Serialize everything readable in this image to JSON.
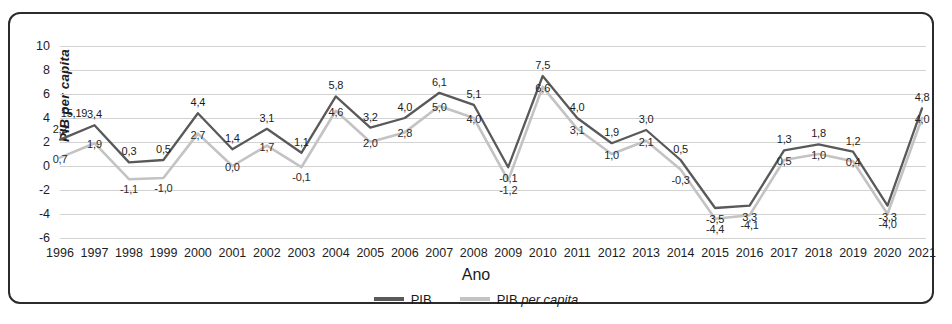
{
  "chart_data": {
    "type": "line",
    "title": "",
    "xlabel": "Ano",
    "ylabel": "PIB per capita",
    "ylim": [
      -6,
      10
    ],
    "yticks": [
      10,
      8,
      6,
      4,
      2,
      0,
      -2,
      -4,
      -6
    ],
    "grid": true,
    "legend_position": "bottom",
    "categories": [
      "1996",
      "1997",
      "1998",
      "1999",
      "2000",
      "2001",
      "2002",
      "2003",
      "2004",
      "2005",
      "2006",
      "2007",
      "2008",
      "2009",
      "2010",
      "2011",
      "2012",
      "2013",
      "2014",
      "2015",
      "2016",
      "2017",
      "2018",
      "2019",
      "2020",
      "2021"
    ],
    "series": [
      {
        "name": "PIB",
        "color": "#595959",
        "values": [
          2.2,
          3.4,
          0.3,
          0.5,
          4.4,
          1.4,
          3.1,
          1.1,
          5.8,
          3.2,
          4.0,
          6.1,
          5.1,
          -0.1,
          7.5,
          4.0,
          1.9,
          3.0,
          0.5,
          -3.5,
          -3.3,
          1.3,
          1.8,
          1.2,
          -3.3,
          4.8
        ],
        "labels": [
          "2,2",
          "3,4",
          "0,3",
          "0,5",
          "4,4",
          "1,4",
          "3,1",
          "1,1",
          "5,8",
          "3,2",
          "4,0",
          "6,1",
          "5,1",
          "-0,1",
          "7,5",
          "4,0",
          "1,9",
          "3,0",
          "0,5",
          "-3,5",
          "3,3",
          "1,3",
          "1,8",
          "1,2",
          "-3,3",
          "4,8"
        ]
      },
      {
        "name": "PIB per capita",
        "color": "#c3c3c3",
        "values": [
          0.7,
          1.9,
          -1.1,
          -1.0,
          2.7,
          0.0,
          1.7,
          -0.1,
          4.6,
          2.0,
          2.8,
          5.0,
          4.0,
          -1.2,
          6.6,
          3.1,
          1.0,
          2.1,
          -0.3,
          -4.4,
          -4.1,
          0.5,
          1.0,
          0.4,
          -4.0,
          4.0
        ],
        "labels": [
          "0,7",
          "1,9",
          "-1,1",
          "-1,0",
          "2,7",
          "0,0",
          "1,7",
          "-0,1",
          "4,6",
          "2,0",
          "2,8",
          "5,0",
          "4,0",
          "-1,2",
          "6,6",
          "3,1",
          "1,0",
          "2,1",
          "-0,3",
          "-4,4",
          "-4,1",
          "0,5",
          "1,0",
          "0,4",
          "-4,0",
          "4,0"
        ]
      }
    ],
    "extra_annotations": [
      {
        "text": "15,19",
        "category": "1996",
        "value": 4.4
      }
    ],
    "legend": [
      {
        "label": "PIB",
        "label_italic": "",
        "color": "#595959"
      },
      {
        "label": "PIB ",
        "label_italic": "per capita",
        "color": "#c3c3c3"
      }
    ]
  }
}
